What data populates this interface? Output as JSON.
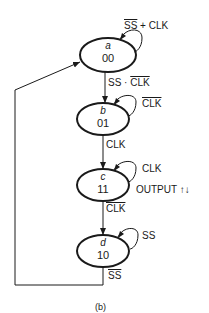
{
  "diagram": {
    "type": "state-diagram",
    "caption": "(b)",
    "states": [
      {
        "name": "a",
        "code": "00",
        "self_loop": {
          "label_parts": [
            {
              "text": "SS",
              "overline": true
            },
            {
              "text": " + CLK",
              "overline": false
            }
          ]
        }
      },
      {
        "name": "b",
        "code": "01",
        "self_loop": {
          "label_parts": [
            {
              "text": "CLK",
              "overline": true
            }
          ]
        }
      },
      {
        "name": "c",
        "code": "11",
        "self_loop": {
          "label_parts": [
            {
              "text": "CLK",
              "overline": false
            }
          ]
        },
        "output": "OUTPUT ↑↓"
      },
      {
        "name": "d",
        "code": "10",
        "self_loop": {
          "label_parts": [
            {
              "text": "SS",
              "overline": false
            }
          ]
        }
      }
    ],
    "transitions": [
      {
        "from": "a",
        "to": "b",
        "label_parts": [
          {
            "text": "SS · ",
            "overline": false
          },
          {
            "text": "CLK",
            "overline": true
          }
        ]
      },
      {
        "from": "b",
        "to": "c",
        "label_parts": [
          {
            "text": "CLK",
            "overline": false
          }
        ]
      },
      {
        "from": "c",
        "to": "d",
        "label_parts": [
          {
            "text": "CLK",
            "overline": true
          }
        ]
      },
      {
        "from": "d",
        "to": "a",
        "label_parts": [
          {
            "text": "SS",
            "overline": true
          }
        ]
      }
    ]
  }
}
